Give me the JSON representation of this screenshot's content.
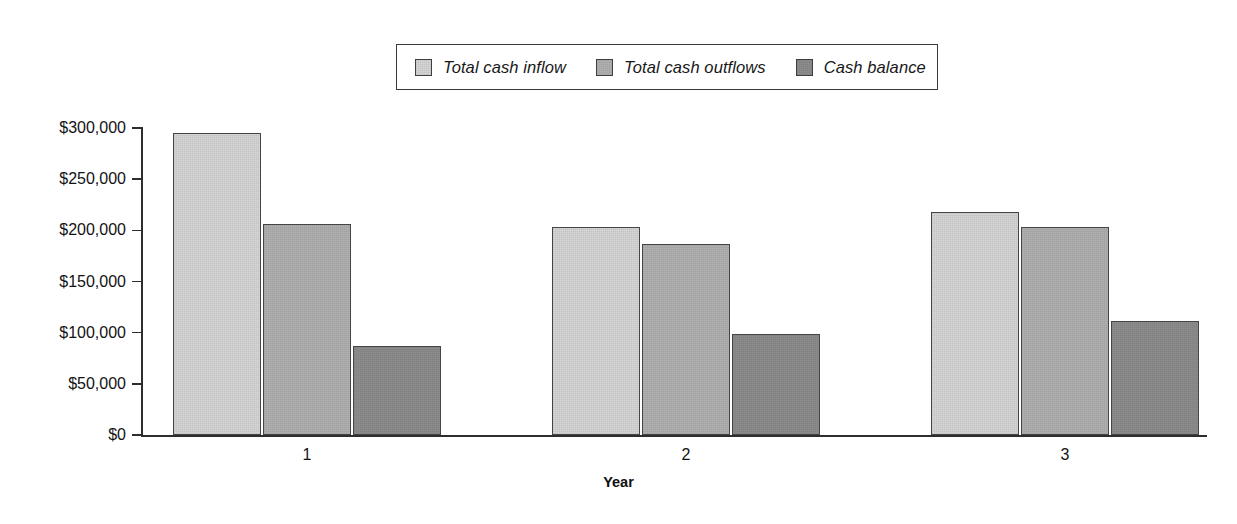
{
  "chart_data": {
    "type": "bar",
    "title": "",
    "xlabel": "Year",
    "ylabel": "",
    "categories": [
      "1",
      "2",
      "3"
    ],
    "series": [
      {
        "name": "Total cash inflow",
        "key": "inflow",
        "color": "#d6d6d6",
        "values": [
          295000,
          203000,
          218000
        ]
      },
      {
        "name": "Total cash outflows",
        "key": "outflow",
        "color": "#b1b1b1",
        "values": [
          206000,
          187000,
          203000
        ]
      },
      {
        "name": "Cash balance",
        "key": "balance",
        "color": "#8d8d8d",
        "values": [
          87000,
          99000,
          111000
        ]
      }
    ],
    "ylim": [
      0,
      300000
    ],
    "ytick_values": [
      0,
      50000,
      100000,
      150000,
      200000,
      250000,
      300000
    ],
    "ytick_labels": [
      "$0",
      "$50,000",
      "$100,000",
      "$150,000",
      "$200,000",
      "$250,000",
      "$300,000"
    ],
    "grid": false,
    "legend_position": "top-center",
    "currency_prefix": "$"
  },
  "legend": {
    "entries": [
      {
        "label": "Total cash inflow",
        "swatch_color": "#d6d6d6"
      },
      {
        "label": "Total cash outflows",
        "swatch_color": "#b1b1b1"
      },
      {
        "label": "Cash balance",
        "swatch_color": "#8d8d8d"
      }
    ]
  },
  "axes": {
    "x_title": "Year",
    "x_categories": [
      "1",
      "2",
      "3"
    ],
    "y_tick_labels": [
      "$300,000",
      "$250,000",
      "$200,000",
      "$150,000",
      "$100,000",
      "$50,000",
      "$0"
    ]
  },
  "colors": {
    "axis": "#2e2e2e",
    "bar_border": "#454545",
    "text": "#131313",
    "background": "#ffffff",
    "legend_border": "#3a3a3a"
  }
}
